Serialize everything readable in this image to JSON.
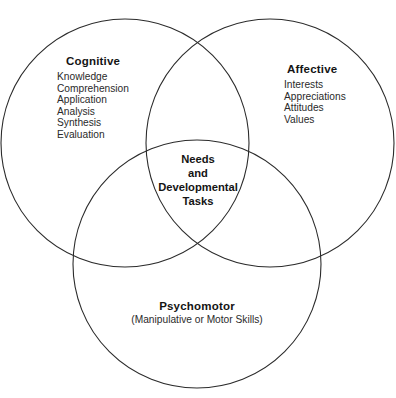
{
  "diagram": {
    "type": "venn-three-circle",
    "stroke_color": "#2b2b2b",
    "background_color": "#ffffff",
    "circles": [
      {
        "name": "cognitive",
        "cx": 125,
        "cy": 143,
        "r": 124
      },
      {
        "name": "affective",
        "cx": 270,
        "cy": 143,
        "r": 124
      },
      {
        "name": "psychomotor",
        "cx": 197,
        "cy": 264,
        "r": 124
      }
    ]
  },
  "cognitive": {
    "title": "Cognitive",
    "items": [
      "Knowledge",
      "Comprehension",
      "Application",
      "Analysis",
      "Synthesis",
      "Evaluation"
    ]
  },
  "affective": {
    "title": "Affective",
    "items": [
      "Interests",
      "Appreciations",
      "Attitudes",
      "Values"
    ]
  },
  "psychomotor": {
    "title": "Psychomotor",
    "subtitle": "(Manipulative or Motor Skills)"
  },
  "center": {
    "lines": [
      "Needs",
      "and",
      "Developmental",
      "Tasks"
    ]
  }
}
